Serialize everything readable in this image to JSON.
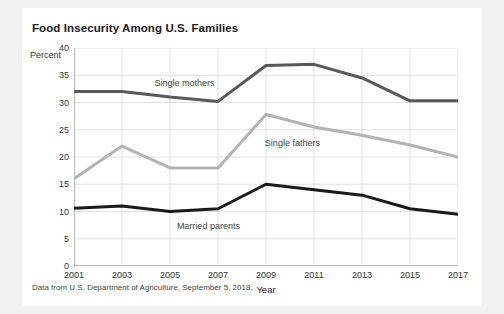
{
  "figure": {
    "title": "Food Insecurity Among U.S. Families",
    "source_note": "Data from U.S. Department of Agriculture, September 5, 2018.",
    "background": "#ffffff",
    "page_background": "#f2f2f2"
  },
  "chart_data": {
    "type": "line",
    "title": "Food Insecurity Among U.S. Families",
    "xlabel": "Year",
    "ylabel": "Percent",
    "x": [
      2001,
      2003,
      2005,
      2007,
      2009,
      2011,
      2013,
      2015,
      2017
    ],
    "categories": [
      "2001",
      "2003",
      "2005",
      "2007",
      "2009",
      "2011",
      "2013",
      "2015",
      "2017"
    ],
    "xlim": [
      2001,
      2017
    ],
    "ylim": [
      0,
      40
    ],
    "yticks": [
      0,
      5,
      10,
      15,
      20,
      25,
      30,
      35,
      40
    ],
    "xticks": [
      2001,
      2003,
      2005,
      2007,
      2009,
      2011,
      2013,
      2015,
      2017
    ],
    "grid": true,
    "legend": "inline-labels",
    "series": [
      {
        "name": "Single mothers",
        "color": "#595959",
        "values": [
          32.0,
          32.0,
          31.0,
          30.2,
          36.8,
          37.0,
          34.5,
          30.3,
          30.3
        ],
        "label_x": 2005.6,
        "label_y": 33.6
      },
      {
        "name": "Single fathers",
        "color": "#b3b3b3",
        "values": [
          16.0,
          22.0,
          18.0,
          18.0,
          27.8,
          25.5,
          24.0,
          22.2,
          20.0
        ],
        "label_x": 2010.1,
        "label_y": 22.6
      },
      {
        "name": "Married parents",
        "color": "#1a1a1a",
        "values": [
          10.6,
          11.0,
          10.0,
          10.5,
          15.0,
          14.0,
          13.0,
          10.5,
          9.5
        ],
        "label_x": 2006.6,
        "label_y": 7.4
      }
    ]
  }
}
